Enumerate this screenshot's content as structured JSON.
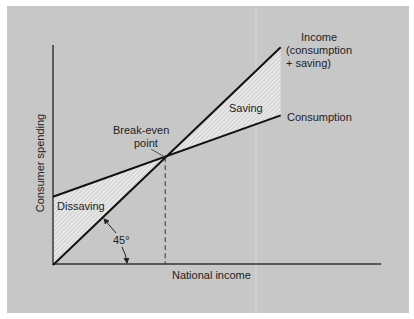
{
  "chart_data": {
    "type": "line",
    "title": "",
    "xlabel": "National income",
    "ylabel": "Consumer spending",
    "grid": false,
    "xlim": [
      0,
      1
    ],
    "ylim": [
      0,
      1
    ],
    "series": [
      {
        "name": "Income",
        "label_lines": [
          "Income",
          "(consumption",
          "+ saving)"
        ],
        "x": [
          0,
          0.69
        ],
        "y": [
          0,
          0.99
        ]
      },
      {
        "name": "Consumption",
        "label_lines": [
          "Consumption"
        ],
        "x": [
          0,
          0.69
        ],
        "y": [
          0.31,
          0.68
        ]
      }
    ],
    "regions": [
      {
        "name": "Dissaving",
        "label": "Dissaving"
      },
      {
        "name": "Saving",
        "label": "Saving"
      }
    ],
    "annotations": {
      "break_even": {
        "label_lines": [
          "Break-even",
          "point"
        ],
        "x": 0.34,
        "y": 0.49
      },
      "angle": {
        "label": "45°"
      }
    }
  }
}
